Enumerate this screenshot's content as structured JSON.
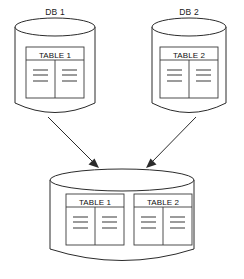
{
  "diagram": {
    "type": "database-consolidation-diagram",
    "colors": {
      "stroke": "#2b2b2b",
      "table_stroke": "#3a3a3a",
      "row_line": "#4a4a4a",
      "background": "#ffffff",
      "text": "#111111"
    },
    "source_databases": [
      {
        "label": "DB 1",
        "tables": [
          {
            "title": "TABLE 1",
            "columns": 2,
            "rows_per_column": 3
          }
        ]
      },
      {
        "label": "DB 2",
        "tables": [
          {
            "title": "TABLE 2",
            "columns": 2,
            "rows_per_column": 3
          }
        ]
      }
    ],
    "target_database": {
      "label": "",
      "tables": [
        {
          "title": "TABLE 1",
          "columns": 2,
          "rows_per_column": 3
        },
        {
          "title": "TABLE 2",
          "columns": 2,
          "rows_per_column": 3
        }
      ]
    },
    "connections": [
      {
        "from": "DB 1",
        "to": "target",
        "style": "arrow"
      },
      {
        "from": "DB 2",
        "to": "target",
        "style": "arrow"
      }
    ]
  }
}
